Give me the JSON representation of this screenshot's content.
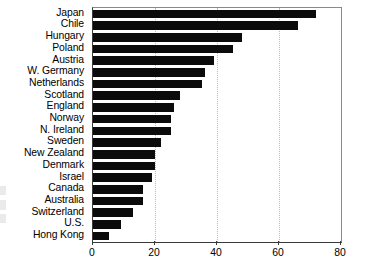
{
  "chart_data": {
    "type": "bar",
    "orientation": "horizontal",
    "title": "",
    "subtitle": "",
    "xlabel": "",
    "ylabel": "",
    "xlim": [
      0,
      80
    ],
    "ylim": null,
    "grid": true,
    "gridlines_x": [
      20,
      40,
      60
    ],
    "legend": null,
    "legend_position": "none",
    "xticks": [
      "0",
      "20",
      "40",
      "60",
      "80"
    ],
    "xtick_values": [
      0,
      20,
      40,
      60,
      80
    ],
    "categories": [
      "Japan",
      "Chile",
      "Hungary",
      "Poland",
      "Austria",
      "W. Germany",
      "Netherlands",
      "Scotland",
      "England",
      "Norway",
      "N. Ireland",
      "Sweden",
      "New Zealand",
      "Denmark",
      "Israel",
      "Canada",
      "Australia",
      "Switzerland",
      "U.S.",
      "Hong Kong"
    ],
    "values": [
      72,
      66,
      48,
      45,
      39,
      36,
      35,
      28,
      26,
      25,
      25,
      22,
      20,
      20,
      19,
      16,
      16,
      13,
      9,
      5
    ],
    "bar_color": "#0b0b0b"
  },
  "axis": {
    "frame_color": "#3a3a3a",
    "gridline_color": "#b9b9b9"
  }
}
